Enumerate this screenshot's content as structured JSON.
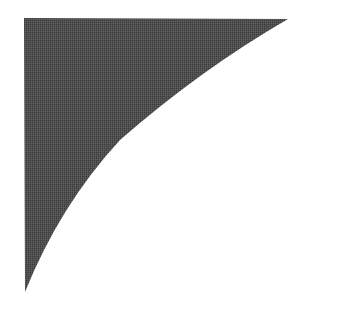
{
  "canvas": {
    "width": 353,
    "height": 327,
    "background_color": "#ffffff",
    "title": "Concave corner fillet silhouette"
  },
  "figure": {
    "name": "corner-fillet-shape",
    "fill_color": "#4d4d4d",
    "fill_texture": "dithered-halftone",
    "edge_color": "#3f3f3f",
    "geometry": {
      "top_edge_y": 18,
      "left_edge_x": 24,
      "right_tip_x": 288,
      "right_tip_y": 20,
      "bottom_tip_x": 24,
      "bottom_tip_y": 292,
      "corner_x": 24,
      "corner_y": 18,
      "arc_type": "concave-elliptical",
      "arc_control_x": 70,
      "arc_control_y": 66,
      "path": "M 24 18 L 288 19 Q 200 70 120 140 Q 60 205 25 292 Z"
    },
    "sample_arc_points": [
      {
        "x": 288,
        "y": 20
      },
      {
        "x": 245,
        "y": 40
      },
      {
        "x": 195,
        "y": 80
      },
      {
        "x": 180,
        "y": 73
      },
      {
        "x": 135,
        "y": 120
      },
      {
        "x": 108,
        "y": 160
      },
      {
        "x": 80,
        "y": 188
      },
      {
        "x": 60,
        "y": 215
      },
      {
        "x": 45,
        "y": 245
      },
      {
        "x": 32,
        "y": 272
      },
      {
        "x": 25,
        "y": 292
      }
    ]
  }
}
